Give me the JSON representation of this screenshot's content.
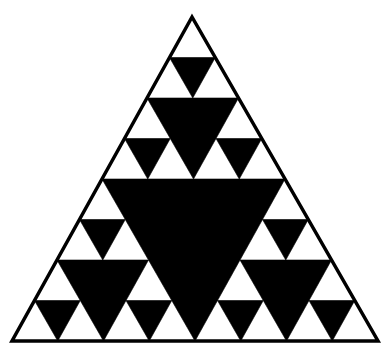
{
  "figure": {
    "type": "sierpinski-triangle",
    "recursion_depth": 3,
    "vertices": {
      "top": [
        192,
        17
      ],
      "bottom_left": [
        12,
        341
      ],
      "bottom_right": [
        378,
        341
      ]
    },
    "colors": {
      "background": "#ffffff",
      "fill_white": "#ffffff",
      "fill_black": "#000000",
      "outline": "#000000"
    },
    "outline_width": 3.5
  }
}
